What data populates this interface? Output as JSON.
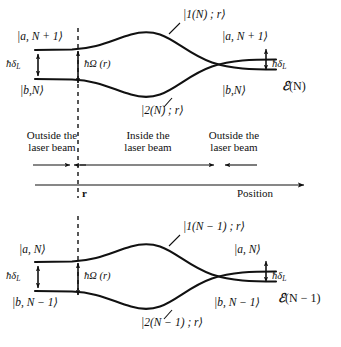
{
  "figure": {
    "type": "energy-level-diagram"
  },
  "upper_panel": {
    "curve_upper_label": "|1(N) ; r⟩",
    "curve_lower_label": "|2(N) ; r⟩",
    "left_upper_state": "|a, N + 1⟩",
    "left_lower_state": "|b,N⟩",
    "right_upper_state": "|a, N + 1⟩",
    "right_lower_state": "|b,N⟩",
    "left_splitting": "ħδ",
    "left_splitting_sub": "L",
    "right_splitting": "ħδ",
    "right_splitting_sub": "L",
    "center_splitting": "ħΩ (r)",
    "manifold_label_glyph": "ℰ",
    "manifold_label_arg": "(N)"
  },
  "lower_panel": {
    "curve_upper_label": "|1(N − 1) ; r⟩",
    "curve_lower_label": "|2(N − 1) ; r⟩",
    "left_upper_state": "|a, N⟩",
    "left_lower_state": "|b, N − 1⟩",
    "right_upper_state": "|a, N⟩",
    "right_lower_state": "|b, N − 1⟩",
    "left_splitting": "ħδ",
    "left_splitting_sub": "L",
    "right_splitting": "ħδ",
    "right_splitting_sub": "L",
    "center_splitting": "ħΩ (r)",
    "manifold_label_glyph": "ℰ",
    "manifold_label_arg": "(N − 1)"
  },
  "regions": {
    "left": "Outside the\nlaser beam",
    "left_line1": "Outside the",
    "left_line2": "laser beam",
    "middle_line1": "Inside the",
    "middle_line2": "laser beam",
    "right_line1": "Outside the",
    "right_line2": "laser beam"
  },
  "axis": {
    "label": "Position",
    "tick_label": "r"
  },
  "colors": {
    "ink": "#111111",
    "background": "#ffffff"
  }
}
